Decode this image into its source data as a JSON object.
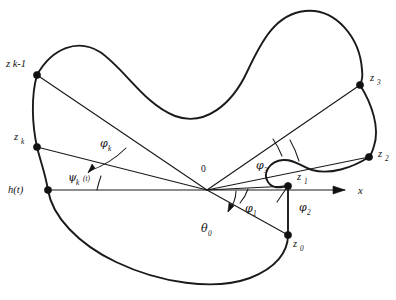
{
  "figure": {
    "background_color": "#ffffff",
    "stroke_color": "#1a1a1a",
    "origin_label": "0",
    "axis": {
      "name": "x-axis",
      "label": "x",
      "arrow": true
    },
    "points": [
      {
        "id": "zk_minus_1",
        "base": "z",
        "sub": "k-1",
        "x": 37,
        "y": 75
      },
      {
        "id": "zk",
        "base": "z",
        "sub": "k",
        "x": 37,
        "y": 147
      },
      {
        "id": "ht",
        "base": "h",
        "sub": "(t)",
        "x": 48,
        "y": 190
      },
      {
        "id": "z3",
        "base": "z",
        "sub": "3",
        "x": 360,
        "y": 85
      },
      {
        "id": "z2",
        "base": "z",
        "sub": "2",
        "x": 369,
        "y": 157
      },
      {
        "id": "z1",
        "base": "z",
        "sub": "1",
        "x": 288,
        "y": 186
      },
      {
        "id": "z0",
        "base": "z",
        "sub": "0",
        "x": 288,
        "y": 235
      }
    ],
    "point_labels": {
      "zk_minus_1": "z k-1",
      "zk": "z",
      "zk_sub": "k",
      "ht": "h(t)",
      "z3": "z",
      "z3_sub": "3",
      "z2": "z",
      "z2_sub": "2",
      "z1": "z",
      "z1_sub": "1",
      "z0": "z",
      "z0_sub": "0"
    },
    "angles": [
      {
        "id": "psi_k",
        "symbol": "ψ",
        "sub": "k",
        "suffix": "(t)",
        "x": 72,
        "y": 177
      },
      {
        "id": "phi_k",
        "symbol": "φ",
        "sub": "k",
        "suffix": "",
        "x": 104,
        "y": 143
      },
      {
        "id": "phi_3",
        "symbol": "φ",
        "sub": "3",
        "suffix": "",
        "x": 260,
        "y": 165
      },
      {
        "id": "phi_1",
        "symbol": "φ",
        "sub": "1",
        "suffix": "",
        "x": 247,
        "y": 208
      },
      {
        "id": "phi_2",
        "symbol": "φ",
        "sub": "2",
        "suffix": "",
        "x": 303,
        "y": 209
      },
      {
        "id": "theta_0",
        "symbol": "θ",
        "sub": "0",
        "suffix": "",
        "x": 205,
        "y": 229
      }
    ],
    "origin": {
      "x": 207,
      "y": 190
    }
  }
}
